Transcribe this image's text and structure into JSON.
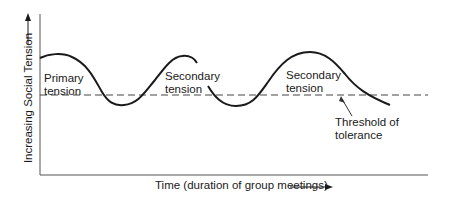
{
  "diagram": {
    "type": "tension-cycle",
    "y_axis_label": "Increasing Social Tension",
    "x_axis_label": "Time (duration of group meetings)",
    "labels": {
      "primary": [
        "Primary",
        "tension"
      ],
      "secondary_1": [
        "Secondary",
        "tension"
      ],
      "secondary_2": [
        "Secondary",
        "tension"
      ],
      "threshold": [
        "Threshold of",
        "tolerance"
      ]
    },
    "colors": {
      "line": "#1a1a1a",
      "axis": "#555555",
      "dashed": "#444444",
      "background": "#ffffff"
    }
  }
}
